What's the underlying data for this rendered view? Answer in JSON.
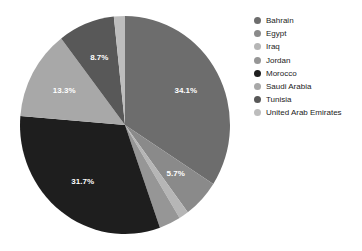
{
  "chart_data": {
    "type": "pie",
    "title": "",
    "subtitle": "",
    "xlabel": "",
    "ylabel": "",
    "grid": false,
    "legend_position": "right",
    "start_angle_deg": 0,
    "direction": "clockwise",
    "categories": [
      "Bahrain",
      "Egypt",
      "Iraq",
      "Jordan",
      "Morocco",
      "Saudi Arabia",
      "Tunisia",
      "United Arab Emirates"
    ],
    "values": [
      34.1,
      5.7,
      1.5,
      3.3,
      31.7,
      13.3,
      8.7,
      1.7
    ],
    "value_unit": "%",
    "colors": [
      "#6d6d6d",
      "#8a8a8a",
      "#b6b6b6",
      "#969696",
      "#1e1e1e",
      "#a8a8a8",
      "#585858",
      "#bdbdbd"
    ],
    "data_labels": [
      {
        "category": "Bahrain",
        "label": "34.1%",
        "shown": true
      },
      {
        "category": "Egypt",
        "label": "5.7%",
        "shown": true
      },
      {
        "category": "Iraq",
        "label": "",
        "shown": false
      },
      {
        "category": "Jordan",
        "label": "",
        "shown": false
      },
      {
        "category": "Morocco",
        "label": "31.7%",
        "shown": true
      },
      {
        "category": "Saudi Arabia",
        "label": "13.3%",
        "shown": true
      },
      {
        "category": "Tunisia",
        "label": "8.7%",
        "shown": true
      },
      {
        "category": "United Arab Emirates",
        "label": "",
        "shown": false
      }
    ]
  },
  "chart": {
    "labels": {
      "bahrain": "34.1%",
      "egypt": "5.7%",
      "morocco": "31.7%",
      "saudi_arabia": "13.3%",
      "tunisia": "8.7%"
    }
  },
  "legend": {
    "items": [
      {
        "label": "Bahrain",
        "color": "#6d6d6d"
      },
      {
        "label": "Egypt",
        "color": "#8a8a8a"
      },
      {
        "label": "Iraq",
        "color": "#b6b6b6"
      },
      {
        "label": "Jordan",
        "color": "#969696"
      },
      {
        "label": "Morocco",
        "color": "#1e1e1e"
      },
      {
        "label": "Saudi Arabia",
        "color": "#a8a8a8"
      },
      {
        "label": "Tunisia",
        "color": "#585858"
      },
      {
        "label": "United Arab Emirates",
        "color": "#bdbdbd"
      }
    ]
  }
}
